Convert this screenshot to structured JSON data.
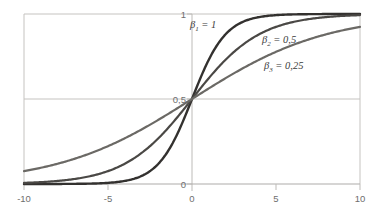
{
  "chart_data": {
    "type": "line",
    "title": "",
    "subtitle": "",
    "xlabel": "",
    "ylabel": "",
    "xlim": [
      -10,
      10
    ],
    "ylim": [
      0,
      1
    ],
    "grid": true,
    "grid_lines": {
      "horizontal_at": [
        0,
        0.5,
        1
      ],
      "vertical_at": [
        -10,
        0,
        10
      ]
    },
    "legend_position": "inline-annotations",
    "xticks": [
      -10,
      -5,
      0,
      5,
      10
    ],
    "xtick_labels": [
      "-10",
      "-5",
      "0",
      "5",
      "10"
    ],
    "yticks": [
      0,
      0.5,
      1
    ],
    "ytick_labels": [
      "0",
      "0,5",
      "1"
    ],
    "function": "logistic: y = 1 / (1 + exp(-beta * x))",
    "series": [
      {
        "name": "beta_1 = 1",
        "label_html": "&beta;<sub>1</sub> = 1",
        "beta": 1,
        "color": "#33312f",
        "line_width": 2.4,
        "x": [
          -10,
          -9,
          -8,
          -7,
          -6,
          -5,
          -4,
          -3,
          -2,
          -1,
          0,
          1,
          2,
          3,
          4,
          5,
          6,
          7,
          8,
          9,
          10
        ],
        "values": [
          4.54e-05,
          0.0001234,
          0.0003354,
          0.0009111,
          0.0024726,
          0.0066929,
          0.0179862,
          0.0474259,
          0.1192029,
          0.2689414,
          0.5,
          0.7310586,
          0.8807971,
          0.9525741,
          0.9820138,
          0.9933071,
          0.9975274,
          0.9990889,
          0.9996646,
          0.9998766,
          0.9999546
        ]
      },
      {
        "name": "beta_2 = 0,5",
        "label_html": "&beta;<sub>2</sub> = 0,5",
        "beta": 0.5,
        "color": "#4a4845",
        "line_width": 2.2,
        "x": [
          -10,
          -9,
          -8,
          -7,
          -6,
          -5,
          -4,
          -3,
          -2,
          -1,
          0,
          1,
          2,
          3,
          4,
          5,
          6,
          7,
          8,
          9,
          10
        ],
        "values": [
          0.0066929,
          0.0109869,
          0.0179862,
          0.0293122,
          0.0474259,
          0.0758582,
          0.1192029,
          0.1824255,
          0.2689414,
          0.3775407,
          0.5,
          0.6224593,
          0.7310586,
          0.8175745,
          0.8807971,
          0.9241418,
          0.9525741,
          0.9706878,
          0.9820138,
          0.9890131,
          0.9933071
        ]
      },
      {
        "name": "beta_3 = 0,25",
        "label_html": "&beta;<sub>3</sub> = 0,25",
        "beta": 0.25,
        "color": "#6b6965",
        "line_width": 2.2,
        "x": [
          -10,
          -9,
          -8,
          -7,
          -6,
          -5,
          -4,
          -3,
          -2,
          -1,
          0,
          1,
          2,
          3,
          4,
          5,
          6,
          7,
          8,
          9,
          10
        ],
        "values": [
          0.0758582,
          0.0954621,
          0.1192029,
          0.1480472,
          0.1824255,
          0.2227001,
          0.2689414,
          0.3208213,
          0.3775407,
          0.4378235,
          0.5,
          0.5621765,
          0.6224593,
          0.6791787,
          0.7310586,
          0.7772999,
          0.8175745,
          0.8519528,
          0.8807971,
          0.9045379,
          0.9241418
        ]
      }
    ],
    "annotations": [
      {
        "text": "beta_1 = 1",
        "x_px": 190,
        "y_px": 27
      },
      {
        "text": "beta_2 = 0,5",
        "x_px": 262,
        "y_px": 42
      },
      {
        "text": "beta_3 = 0,25",
        "x_px": 265,
        "y_px": 68
      }
    ],
    "colors": {
      "axis": "#b4b2ae",
      "grid": "#c8c6c2",
      "frame": "#c0bebb",
      "tick_text": "#6e6e6e",
      "annotation_text": "#3b3b3b",
      "background": "#ffffff"
    }
  },
  "axes": {
    "x_ticks": [
      {
        "value": -10,
        "label": "-10"
      },
      {
        "value": -5,
        "label": "-5"
      },
      {
        "value": 0,
        "label": "0"
      },
      {
        "value": 5,
        "label": "5"
      },
      {
        "value": 10,
        "label": "10"
      }
    ],
    "y_ticks": [
      {
        "value": 1,
        "label": "1"
      },
      {
        "value": 0.5,
        "label": "0,5"
      },
      {
        "value": 0,
        "label": "0"
      }
    ]
  },
  "annotation_labels": {
    "beta1_symbol": "β",
    "beta1_sub": "1",
    "beta1_value": " = 1",
    "beta2_symbol": "β",
    "beta2_sub": "2",
    "beta2_value": " = 0,5",
    "beta3_symbol": "β",
    "beta3_sub": "3",
    "beta3_value": " = 0,25"
  }
}
